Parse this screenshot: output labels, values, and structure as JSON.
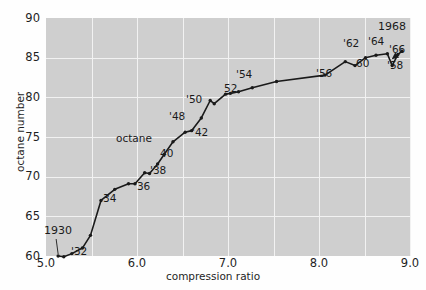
{
  "chart_data": {
    "type": "line",
    "title": "",
    "xlabel": "compression ratio",
    "ylabel": "octane number",
    "xlim": [
      5.0,
      9.5
    ],
    "ylim": [
      60,
      90
    ],
    "xticks": [
      "5.0",
      "6.0",
      "7.0",
      "8.0",
      "9.0"
    ],
    "xtick_values": [
      5.0,
      6.0,
      7.0,
      8.0,
      9.0
    ],
    "yticks": [
      "60",
      "65",
      "70",
      "75",
      "80",
      "85",
      "90"
    ],
    "ytick_values": [
      60,
      65,
      70,
      75,
      80,
      85,
      90
    ],
    "grid": true,
    "legend": "none",
    "series_name": "octane",
    "x": [
      5.15,
      5.22,
      5.32,
      5.45,
      5.55,
      5.68,
      5.85,
      6.02,
      6.1,
      6.22,
      6.28,
      6.38,
      6.46,
      6.57,
      6.72,
      6.8,
      6.92,
      7.03,
      7.08,
      7.22,
      7.28,
      7.38,
      7.55,
      7.85,
      8.45,
      8.7,
      8.82,
      8.95,
      9.08,
      9.22,
      9.28,
      9.35,
      9.4
    ],
    "y": [
      60.0,
      59.9,
      60.3,
      61.0,
      62.6,
      67.0,
      68.4,
      69.1,
      69.1,
      70.5,
      70.4,
      71.6,
      72.8,
      74.4,
      75.6,
      75.8,
      77.4,
      79.6,
      79.2,
      80.4,
      80.5,
      80.7,
      81.2,
      82.0,
      82.8,
      84.5,
      84.0,
      85.0,
      85.3,
      85.5,
      84.0,
      85.4,
      85.8
    ],
    "annotations": [
      {
        "label": "1930",
        "x": 5.15,
        "y": 60.0,
        "note": "leader line to first point"
      },
      {
        "label": "'32",
        "x": 5.32,
        "y": 60.3
      },
      {
        "label": "34",
        "x": 5.68,
        "y": 67.0
      },
      {
        "label": "'36",
        "x": 6.02,
        "y": 69.1
      },
      {
        "label": "'38",
        "x": 6.22,
        "y": 70.5
      },
      {
        "label": "40",
        "x": 6.38,
        "y": 71.6
      },
      {
        "label": "octane",
        "x": 6.1,
        "y": 73.2,
        "note": "series label"
      },
      {
        "label": "'42",
        "x": 6.57,
        "y": 74.4
      },
      {
        "label": "'48",
        "x": 6.72,
        "y": 75.6
      },
      {
        "label": "'50",
        "x": 6.92,
        "y": 77.4
      },
      {
        "label": "52",
        "x": 7.08,
        "y": 79.2
      },
      {
        "label": "'54",
        "x": 7.28,
        "y": 80.5
      },
      {
        "label": "'56",
        "x": 8.1,
        "y": 82.2
      },
      {
        "label": "'58",
        "x": 9.28,
        "y": 84.0
      },
      {
        "label": "60",
        "x": 9.0,
        "y": 84.0
      },
      {
        "label": "'62",
        "x": 8.82,
        "y": 85.0
      },
      {
        "label": "'64",
        "x": 9.02,
        "y": 85.2
      },
      {
        "label": "'66",
        "x": 9.2,
        "y": 85.4
      },
      {
        "label": "1968",
        "x": 9.4,
        "y": 85.8
      }
    ]
  },
  "axes": {
    "ylabel": "octane number",
    "xlabel": "compression ratio",
    "yticks": [
      "90",
      "85",
      "80",
      "75",
      "70",
      "65",
      "60"
    ],
    "xticks": [
      "5.0",
      "6.0",
      "7.0",
      "8.0",
      "9.0"
    ]
  },
  "annotations": {
    "a_1930": "1930",
    "a_32": "'32",
    "a_34": "34",
    "a_36": "'36",
    "a_38": "'38",
    "a_40": "40",
    "a_octane": "octane",
    "a_42": "'42",
    "a_48": "'48",
    "a_50": "'50",
    "a_52": "52",
    "a_54": "'54",
    "a_56": "'56",
    "a_58": "'58",
    "a_60": "60",
    "a_62": "'62",
    "a_64": "'64",
    "a_66": "'66",
    "a_1968": "1968"
  },
  "colors": {
    "panel": "#cfcfcf",
    "grid": "#f2f2f2",
    "line": "#1a1a1a",
    "text": "#1f1f1f",
    "page": "#fefefe"
  }
}
